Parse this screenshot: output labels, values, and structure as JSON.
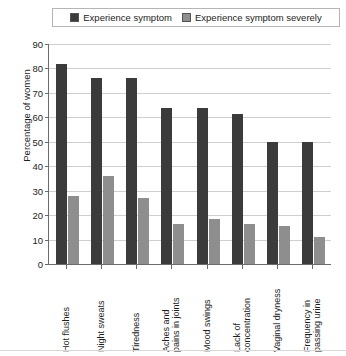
{
  "chart_data": {
    "type": "bar",
    "title": "",
    "xlabel": "",
    "ylabel": "Percentage of women",
    "ylim": [
      0,
      90
    ],
    "ytick_step": 10,
    "yticks": [
      90,
      80,
      70,
      60,
      50,
      40,
      30,
      20,
      10,
      0
    ],
    "grid": true,
    "legend_position": "top",
    "categories": [
      "Hot flushes",
      "Night sweats",
      "Tiredness",
      "Aches and pains in joints",
      "Mood swings",
      "Lack of concentration",
      "Vaginal dryness",
      "Frequency in passing urine"
    ],
    "category_lines": [
      [
        "Hot flushes"
      ],
      [
        "Night sweats"
      ],
      [
        "Tiredness"
      ],
      [
        "Aches and",
        "pains in joints"
      ],
      [
        "Mood swings"
      ],
      [
        "Lack of",
        "concentration"
      ],
      [
        "Vaginal dryness"
      ],
      [
        "Frequency in",
        "passing urine"
      ]
    ],
    "series": [
      {
        "name": "Experience symptom",
        "color": "#3b3b3b",
        "values": [
          82,
          76,
          76,
          64,
          64,
          61.5,
          50,
          50
        ]
      },
      {
        "name": "Experience symptom severely",
        "color": "#8e8e8e",
        "values": [
          28,
          36,
          27,
          16.5,
          18.5,
          16.5,
          15.5,
          11
        ]
      }
    ]
  },
  "legend": {
    "entries": [
      {
        "label": "Experience symptom",
        "swatch": "legend-swatch-dark"
      },
      {
        "label": "Experience symptom severely",
        "swatch": "legend-swatch-gray"
      }
    ]
  },
  "axis": {
    "y_title": "Percentage of women"
  }
}
